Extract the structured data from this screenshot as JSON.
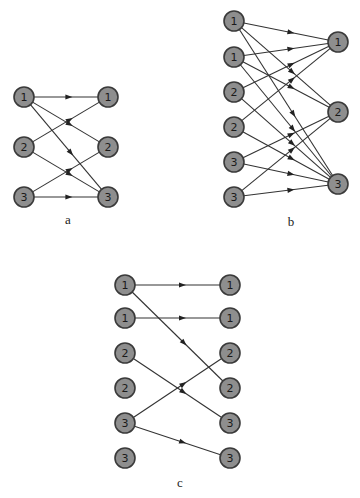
{
  "style": {
    "node_fill": "#8e8e8e",
    "node_stroke": "#3a3a3a",
    "edge_color": "#333333",
    "node_radius": 10
  },
  "diagrams": [
    {
      "id": "a",
      "caption": "a",
      "caption_pos": [
        68,
        224
      ],
      "left": [
        {
          "label": "1",
          "x": 24,
          "y": 97
        },
        {
          "label": "2",
          "x": 24,
          "y": 147
        },
        {
          "label": "3",
          "x": 24,
          "y": 197
        }
      ],
      "right": [
        {
          "label": "1",
          "x": 108,
          "y": 97
        },
        {
          "label": "2",
          "x": 108,
          "y": 147
        },
        {
          "label": "3",
          "x": 108,
          "y": 197
        }
      ],
      "edges": [
        [
          0,
          0
        ],
        [
          0,
          1
        ],
        [
          0,
          2
        ],
        [
          1,
          0
        ],
        [
          1,
          2
        ],
        [
          2,
          1
        ],
        [
          2,
          2
        ]
      ]
    },
    {
      "id": "b",
      "caption": "b",
      "caption_pos": [
        291,
        226
      ],
      "left": [
        {
          "label": "1",
          "x": 234,
          "y": 21
        },
        {
          "label": "1",
          "x": 234,
          "y": 57
        },
        {
          "label": "2",
          "x": 234,
          "y": 92
        },
        {
          "label": "2",
          "x": 234,
          "y": 127
        },
        {
          "label": "3",
          "x": 234,
          "y": 162
        },
        {
          "label": "3",
          "x": 234,
          "y": 197
        }
      ],
      "right": [
        {
          "label": "1",
          "x": 338,
          "y": 42
        },
        {
          "label": "2",
          "x": 338,
          "y": 112
        },
        {
          "label": "3",
          "x": 338,
          "y": 184
        }
      ],
      "edges": [
        [
          0,
          0
        ],
        [
          0,
          1
        ],
        [
          0,
          2
        ],
        [
          1,
          0
        ],
        [
          1,
          1
        ],
        [
          1,
          2
        ],
        [
          2,
          0
        ],
        [
          2,
          2
        ],
        [
          3,
          0
        ],
        [
          3,
          2
        ],
        [
          4,
          1
        ],
        [
          4,
          2
        ],
        [
          5,
          1
        ],
        [
          5,
          2
        ]
      ]
    },
    {
      "id": "c",
      "caption": "c",
      "caption_pos": [
        180,
        487
      ],
      "left": [
        {
          "label": "1",
          "x": 125,
          "y": 285
        },
        {
          "label": "1",
          "x": 125,
          "y": 318
        },
        {
          "label": "2",
          "x": 125,
          "y": 353
        },
        {
          "label": "2",
          "x": 125,
          "y": 388
        },
        {
          "label": "3",
          "x": 125,
          "y": 423
        },
        {
          "label": "3",
          "x": 125,
          "y": 458
        }
      ],
      "right": [
        {
          "label": "1",
          "x": 230,
          "y": 285
        },
        {
          "label": "1",
          "x": 230,
          "y": 318
        },
        {
          "label": "2",
          "x": 230,
          "y": 353
        },
        {
          "label": "2",
          "x": 230,
          "y": 388
        },
        {
          "label": "3",
          "x": 230,
          "y": 423
        },
        {
          "label": "3",
          "x": 230,
          "y": 458
        }
      ],
      "edges": [
        [
          0,
          0
        ],
        [
          0,
          3
        ],
        [
          1,
          1
        ],
        [
          2,
          4
        ],
        [
          4,
          2
        ],
        [
          4,
          5
        ]
      ]
    }
  ]
}
